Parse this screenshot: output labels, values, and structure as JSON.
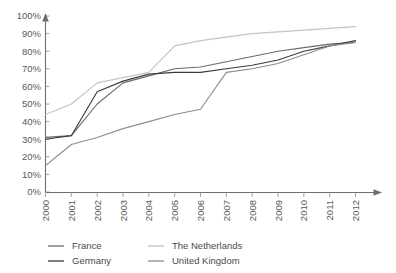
{
  "chart_data": {
    "type": "line",
    "title": "",
    "xlabel": "",
    "ylabel": "",
    "x": [
      "2000",
      "2001",
      "2002",
      "2003",
      "2004",
      "2005",
      "2006",
      "2007",
      "2008",
      "2009",
      "2010",
      "2011",
      "2012"
    ],
    "categories": [
      "2000",
      "2001",
      "2002",
      "2003",
      "2004",
      "2005",
      "2006",
      "2007",
      "2008",
      "2009",
      "2010",
      "2011",
      "2012"
    ],
    "ylim": [
      0,
      100
    ],
    "yticks": [
      0,
      10,
      20,
      30,
      40,
      50,
      60,
      70,
      80,
      90,
      100
    ],
    "ytick_labels": [
      "0%",
      "10%",
      "20%",
      "30%",
      "40%",
      "50%",
      "60%",
      "70%",
      "80%",
      "90%",
      "100%"
    ],
    "grid": false,
    "legend_position": "bottom",
    "series": [
      {
        "name": "France",
        "color": "#6b6b6d",
        "values": [
          31,
          32,
          50,
          62,
          66,
          70,
          71,
          74,
          77,
          80,
          82,
          84,
          85
        ]
      },
      {
        "name": "Germany",
        "color": "#3c3c3e",
        "values": [
          30,
          32,
          57,
          63,
          67,
          68,
          68,
          70,
          72,
          75,
          80,
          83,
          86
        ]
      },
      {
        "name": "The Netherlands",
        "color": "#c4c4c6",
        "values": [
          44,
          50,
          62,
          65,
          68,
          83,
          86,
          88,
          90,
          91,
          92,
          93,
          94
        ]
      },
      {
        "name": "United Kingdom",
        "color": "#8d8d8f",
        "values": [
          15,
          27,
          31,
          36,
          40,
          44,
          47,
          68,
          70,
          73,
          78,
          83,
          85
        ]
      }
    ]
  },
  "axes": {
    "y_axis_name": "y-axis",
    "x_axis_name": "x-axis"
  },
  "legend": {
    "entries": [
      {
        "label": "France",
        "color": "#6b6b6d"
      },
      {
        "label": "The Netherlands",
        "color": "#c4c4c6"
      },
      {
        "label": "Germany",
        "color": "#3c3c3e"
      },
      {
        "label": "United Kingdom",
        "color": "#8d8d8f"
      }
    ]
  }
}
